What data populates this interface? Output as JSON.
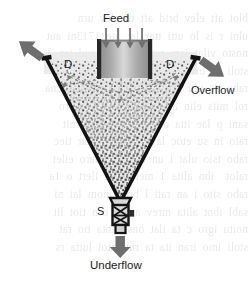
{
  "figure": {
    "type": "deep-cone-thickener-schematic",
    "labels": {
      "feed": "Feed",
      "dilution_left": "D",
      "dilution_right": "D",
      "overflow": "Overflow",
      "spigot": "S",
      "underflow": "Underflow"
    },
    "background_bleed_text": "blot aft elev brid aft ta elev urn\nulni r is lo utti ttar lat hte 1713ni aut\nnosto vilat iam reta imu ein sud iar\nstoli se bria nts itta rutt amoi nlut as\nrabo tis ulu mna artn ta aes clitu ecna\nrol mits elin alu ocs blot i rev aero\nsani p lae itta onsi e blo ralo urnit\nraio in su etoc lav h alo 1 intar tiec\nrabo tsio ulat i un isat ilo maro eilet\nralot  ibn alita 1 mei c tae ilert o 1a\nrabo sito i an rati l brev atom lai ni\nsabl ibnt alita mrev ani e cen tiot lit\nnoitu igro c ta ilat onsit inta tio rat\nstoli imo iran ita ta rutt atoi lutta rs",
    "colors": {
      "outline": "#161616",
      "arrow_gray": "#6b6b6b",
      "sediment_speckle": "#3a3a3a",
      "suspension_fill": "#ececec",
      "feedwell_wall": "#2a2a2a",
      "dashed_flow": "#8a8a8a",
      "clear_liquor": "#e6e6e6",
      "label_text": "#1c1c1c",
      "page_background": "#ffffff"
    },
    "geometry": {
      "cone_rim_left_x": 45,
      "cone_rim_right_x": 196,
      "cone_rim_y": 58,
      "cone_apex_x": 120,
      "cone_apex_y": 202,
      "feedwell_left_x": 97,
      "feedwell_right_x": 152,
      "feedwell_top_y": 40,
      "feedwell_bottom_y": 78,
      "feed_arrow_count": 4,
      "spigot_top_y": 202,
      "spigot_bottom_y": 228
    }
  }
}
